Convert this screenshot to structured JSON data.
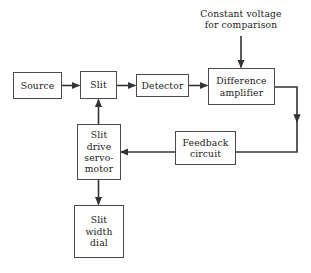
{
  "diagram": {
    "background_color": "#ffffff",
    "line_color": "#333333",
    "box_border_color": "#4a4a4a",
    "text_color": "#1a1a1a",
    "annotations": [
      {
        "id": "constant-voltage-note",
        "text": "Constant voltage\nfor comparison"
      }
    ],
    "nodes": [
      {
        "id": "source",
        "label": "Source"
      },
      {
        "id": "slit",
        "label": "Slit"
      },
      {
        "id": "detector",
        "label": "Detector"
      },
      {
        "id": "difference-amplifier",
        "label": "Difference\namplifier"
      },
      {
        "id": "slit-drive-servo-motor",
        "label": "Slit\ndrive\nservo-\nmotor"
      },
      {
        "id": "feedback-circuit",
        "label": "Feedback\ncircuit"
      },
      {
        "id": "slit-width-dial",
        "label": "Slit\nwidth\ndial"
      }
    ],
    "connections": [
      {
        "id": "source-to-slit",
        "from": "source",
        "to": "slit",
        "direction": "right"
      },
      {
        "id": "slit-to-detector",
        "from": "slit",
        "to": "detector",
        "direction": "right"
      },
      {
        "id": "detector-to-difference-amplifier",
        "from": "detector",
        "to": "difference-amplifier",
        "direction": "right"
      },
      {
        "id": "constant-voltage-to-difference-amplifier",
        "from": "constant-voltage-note",
        "to": "difference-amplifier",
        "direction": "down"
      },
      {
        "id": "difference-amplifier-to-feedback-circuit",
        "from": "difference-amplifier",
        "to": "feedback-circuit",
        "direction": "down-then-left"
      },
      {
        "id": "feedback-circuit-to-servo-motor",
        "from": "feedback-circuit",
        "to": "slit-drive-servo-motor",
        "direction": "left"
      },
      {
        "id": "servo-motor-to-slit",
        "from": "slit-drive-servo-motor",
        "to": "slit",
        "direction": "up"
      },
      {
        "id": "servo-motor-to-slit-width-dial",
        "from": "slit-drive-servo-motor",
        "to": "slit-width-dial",
        "direction": "down"
      }
    ]
  }
}
